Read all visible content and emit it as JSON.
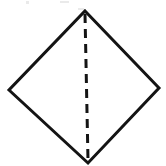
{
  "figure": {
    "title": "Diamond with vertical dashed fold line",
    "background_color": "#ffffff",
    "canvas": {
      "width": 166,
      "height": 166
    },
    "shape": {
      "name": "diamond-outline",
      "type": "rhombus",
      "stroke_color": "#141414",
      "stroke_width": 3,
      "fill": "none",
      "vertices": {
        "top": {
          "x": 85,
          "y": 11
        },
        "right": {
          "x": 159,
          "y": 88
        },
        "bottom": {
          "x": 88,
          "y": 163
        },
        "left": {
          "x": 9,
          "y": 90
        }
      },
      "points": "85,11 159,88 88,163 9,90"
    },
    "fold_line": {
      "name": "dashed-fold-line",
      "type": "dashed-segment",
      "stroke_color": "#141414",
      "stroke_width": 3,
      "dash_length": 9,
      "gap_length": 6,
      "dasharray": "9 6",
      "from": {
        "x": 85,
        "y": 14
      },
      "to": {
        "x": 88,
        "y": 160
      }
    },
    "artifacts": [
      {
        "name": "scan-speck-1",
        "x": 26,
        "y": 1,
        "width": 3,
        "height": 3
      },
      {
        "name": "scan-speck-2",
        "x": 60,
        "y": 1,
        "width": 9,
        "height": 2
      },
      {
        "name": "scan-speck-3",
        "x": 78,
        "y": 8,
        "width": 6,
        "height": 2
      }
    ]
  }
}
